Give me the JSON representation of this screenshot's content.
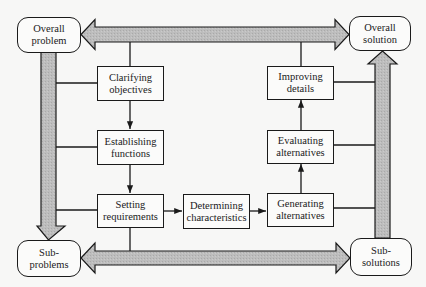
{
  "diagram": {
    "type": "process-flowchart",
    "colors": {
      "background": "#f7f7f6",
      "line": "#1a1a1a",
      "arrow_fill": "#b9b9b9"
    },
    "corners": {
      "overall_problem": {
        "line1": "Overall",
        "line2": "problem"
      },
      "overall_solution": {
        "line1": "Overall",
        "line2": "solution"
      },
      "sub_problems": {
        "line1": "Sub-",
        "line2": "problems"
      },
      "sub_solutions": {
        "line1": "Sub-",
        "line2": "solutions"
      }
    },
    "steps": {
      "clarifying_objectives": {
        "line1": "Clarifying",
        "line2": "objectives"
      },
      "establishing_functions": {
        "line1": "Establishing",
        "line2": "functions"
      },
      "setting_requirements": {
        "line1": "Setting",
        "line2": "requirements"
      },
      "determining_characteristics": {
        "line1": "Determining",
        "line2": "characteristics"
      },
      "generating_alternatives": {
        "line1": "Generating",
        "line2": "alternatives"
      },
      "evaluating_alternatives": {
        "line1": "Evaluating",
        "line2": "alternatives"
      },
      "improving_details": {
        "line1": "Improving",
        "line2": "details"
      }
    },
    "flows": [
      {
        "from": "Clarifying objectives",
        "to": "Establishing functions"
      },
      {
        "from": "Establishing functions",
        "to": "Setting requirements"
      },
      {
        "from": "Setting requirements",
        "to": "Determining characteristics"
      },
      {
        "from": "Determining characteristics",
        "to": "Generating alternatives"
      },
      {
        "from": "Generating alternatives",
        "to": "Evaluating alternatives"
      },
      {
        "from": "Evaluating alternatives",
        "to": "Improving details"
      },
      {
        "from": "Overall problem",
        "to": "Sub-problems",
        "style": "wide-arrow"
      },
      {
        "from": "Sub-solutions",
        "to": "Overall solution",
        "style": "wide-arrow"
      },
      {
        "between": [
          "Overall problem",
          "Overall solution"
        ],
        "style": "wide-double-arrow"
      },
      {
        "between": [
          "Sub-problems",
          "Sub-solutions"
        ],
        "style": "wide-double-arrow"
      }
    ]
  }
}
